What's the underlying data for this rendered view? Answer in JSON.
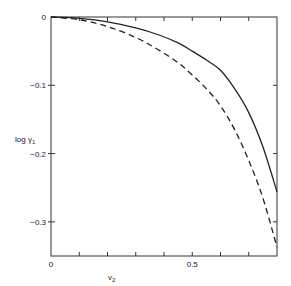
{
  "chart_data": {
    "type": "line",
    "title": "",
    "xlabel": "v2",
    "ylabel": "log γ1",
    "xlim": [
      0,
      0.8
    ],
    "ylim": [
      -0.35,
      0
    ],
    "grid": false,
    "legend": null,
    "x_ticks": [
      0,
      0.1,
      0.2,
      0.3,
      0.4,
      0.5,
      0.6,
      0.7,
      0.8
    ],
    "x_tick_labels": [
      {
        "value": 0,
        "label": "0"
      },
      {
        "value": 0.5,
        "label": "0.5"
      }
    ],
    "y_ticks": [
      0,
      -0.1,
      -0.2,
      -0.3
    ],
    "y_tick_labels": [
      {
        "value": 0,
        "label": "0"
      },
      {
        "value": -0.1,
        "label": "-0.1"
      },
      {
        "value": -0.2,
        "label": "-0.2"
      },
      {
        "value": -0.3,
        "label": "-0.3"
      }
    ],
    "series": [
      {
        "name": "solid",
        "style": "solid",
        "x": [
          0,
          0.1,
          0.2,
          0.3,
          0.38,
          0.45,
          0.5,
          0.55,
          0.6,
          0.65,
          0.7,
          0.75,
          0.8
        ],
        "y": [
          0,
          -0.002,
          -0.007,
          -0.016,
          -0.026,
          -0.038,
          -0.05,
          -0.063,
          -0.078,
          -0.105,
          -0.14,
          -0.19,
          -0.256
        ]
      },
      {
        "name": "dashed",
        "style": "dashed",
        "x": [
          0,
          0.1,
          0.2,
          0.3,
          0.38,
          0.45,
          0.5,
          0.55,
          0.6,
          0.65,
          0.7,
          0.75,
          0.8
        ],
        "y": [
          0,
          -0.004,
          -0.014,
          -0.03,
          -0.048,
          -0.067,
          -0.085,
          -0.105,
          -0.13,
          -0.165,
          -0.21,
          -0.265,
          -0.337
        ]
      }
    ]
  },
  "labels": {
    "xlabel_main": "v",
    "xlabel_sub": "2",
    "ylabel_main": "log γ",
    "ylabel_sub": "1"
  }
}
